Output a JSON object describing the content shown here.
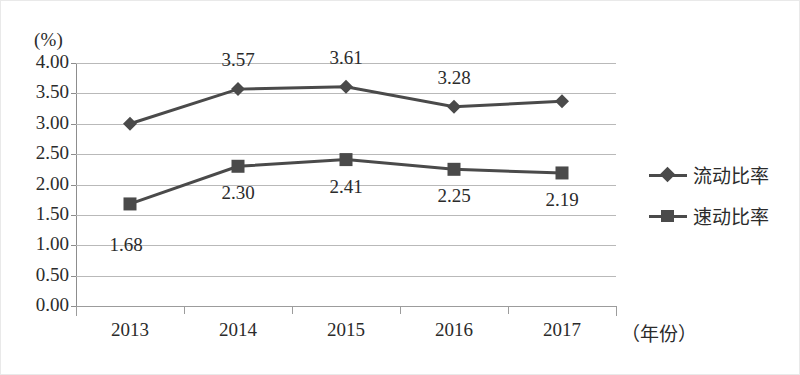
{
  "chart_data": {
    "type": "line",
    "title": "",
    "xlabel": "（年份）",
    "ylabel": "(%)",
    "ylim": [
      0,
      4
    ],
    "ytick_step": 0.5,
    "grid": true,
    "legend_position": "right",
    "categories": [
      "2013",
      "2014",
      "2015",
      "2016",
      "2017"
    ],
    "ytick_labels": [
      "0.00",
      "0.50",
      "1.00",
      "1.50",
      "2.00",
      "2.50",
      "3.00",
      "3.50",
      "4.00"
    ],
    "series": [
      {
        "name": "流动比率",
        "marker": "diamond",
        "color": "#4a4a4a",
        "values": [
          3.0,
          3.57,
          3.61,
          3.28,
          3.37
        ],
        "labels": [
          "",
          "3.57",
          "3.61",
          "3.28",
          ""
        ]
      },
      {
        "name": "速动比率",
        "marker": "square",
        "color": "#4a4a4a",
        "values": [
          1.68,
          2.3,
          2.41,
          2.25,
          2.19
        ],
        "labels": [
          "1.68",
          "2.30",
          "2.41",
          "2.25",
          "2.19"
        ]
      }
    ]
  },
  "legend": {
    "items": [
      {
        "label": "流动比率",
        "marker": "diamond"
      },
      {
        "label": "速动比率",
        "marker": "square"
      }
    ]
  }
}
